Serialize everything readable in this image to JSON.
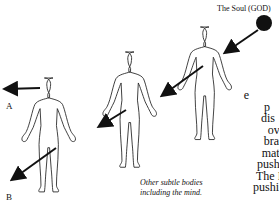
{
  "soul": {
    "label": "The Soul (GOD)",
    "color": "#111111"
  },
  "labels": {
    "a": "A",
    "b": "B"
  },
  "caption": {
    "line1": "Other subtle bodies",
    "line2": "including the mind."
  },
  "side_text": {
    "lines": [
      "e",
      "p",
      "dis",
      "ove",
      "bran",
      "mate",
      "pushe",
      "The L",
      "pushin"
    ]
  },
  "figures": [
    {
      "name": "figure-left"
    },
    {
      "name": "figure-middle"
    },
    {
      "name": "figure-right"
    }
  ]
}
